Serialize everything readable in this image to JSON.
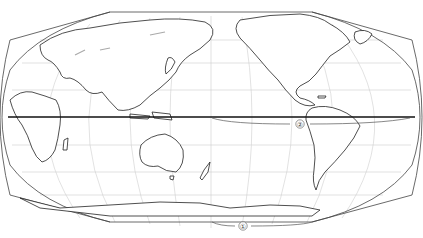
{
  "map": {
    "title": "",
    "projection": "Pacific-centered world map (polyconic-style outline)",
    "labels": [
      {
        "id": "label-1",
        "text": "①",
        "x": 243,
        "y": 226,
        "meaning": "bracket along southern map edge"
      },
      {
        "id": "label-2",
        "text": "②",
        "x": 300,
        "y": 124,
        "meaning": "bracket along equator"
      }
    ],
    "features": {
      "equator": {
        "y": 117
      },
      "continents": [
        "Europe",
        "Africa",
        "Asia",
        "Australia",
        "New Zealand",
        "Antarctica",
        "North America",
        "South America",
        "Greenland"
      ]
    },
    "colors": {
      "coast": "#222222",
      "grid": "#cfcfcf",
      "equator": "#111111",
      "background": "#ffffff"
    }
  }
}
